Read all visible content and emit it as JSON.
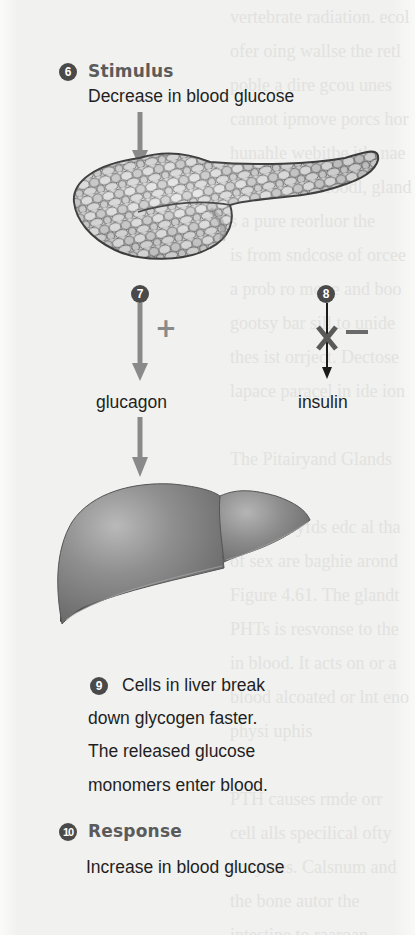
{
  "figure": {
    "colors": {
      "background": "#f3f3f1",
      "badge": "#4a4a4a",
      "heading": "#5b5b5b",
      "text": "#1f1f1f",
      "stimulatory_arrow": "#8a8a8a",
      "inhibited_arrow": "#1a1a1a",
      "organ_fill": "#8e8e8e"
    }
  },
  "stimulus": {
    "step_number": "6",
    "heading": "Stimulus",
    "description": "Decrease in blood glucose"
  },
  "organs": {
    "pancreas": {
      "icon": "pancreas-illustration"
    },
    "liver": {
      "icon": "liver-illustration"
    }
  },
  "glucagon_branch": {
    "step_number": "7",
    "sign": "+",
    "hormone": "glucagon",
    "arrow": "stimulatory-arrow"
  },
  "insulin_branch": {
    "step_number": "8",
    "sign": "−",
    "hormone": "insulin",
    "arrow": "blocked-arrow"
  },
  "liver_action": {
    "step_number": "9",
    "lines": [
      "Cells in liver break",
      "down glycogen faster.",
      "The released glucose",
      "monomers enter blood."
    ]
  },
  "response": {
    "step_number": "10",
    "heading": "Response",
    "description": "Increase in blood glucose"
  }
}
